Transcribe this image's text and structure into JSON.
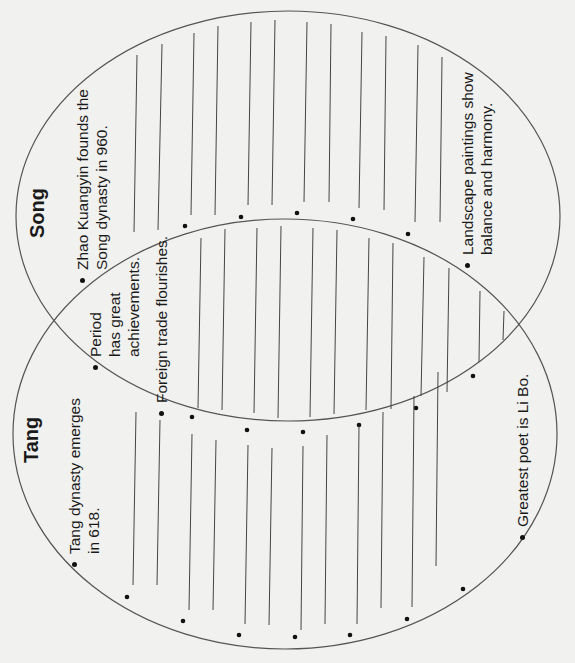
{
  "diagram": {
    "type": "venn",
    "orientation": "rotated-90-ccw",
    "colors": {
      "background": "#f1f1ef",
      "line": "#555555",
      "text": "#1a1a1a",
      "bullet": "#111111"
    },
    "sets": [
      {
        "id": "song",
        "title": "Song",
        "bullets": [
          {
            "lines": [
              "Zhao Kuangyin founds the",
              "Song dynasty in 960."
            ]
          },
          {
            "lines": [
              "Landscape paintings show",
              "balance and harmony."
            ]
          }
        ],
        "blank_lines": 7,
        "blank_bullets": 4
      },
      {
        "id": "tang",
        "title": "Tang",
        "bullets": [
          {
            "lines": [
              "Tang dynasty emerges",
              "in 618."
            ]
          },
          {
            "lines": [
              "Greatest poet is Li Bo."
            ]
          }
        ],
        "blank_lines": 8,
        "blank_bullets": 5
      }
    ],
    "intersection": {
      "bullets": [
        {
          "lines": [
            "Period",
            "has great",
            "achievements."
          ]
        },
        {
          "lines": [
            "Foreign trade flourishes."
          ]
        }
      ],
      "blank_lines": 11,
      "blank_bullets": 5
    }
  }
}
